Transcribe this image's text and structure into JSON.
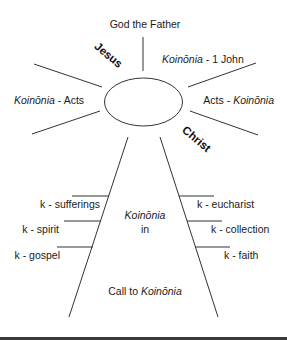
{
  "diagram": {
    "top_label": "God the Father",
    "jesus_label": "Jesus",
    "christ_label": "Christ",
    "upper_right": {
      "italic": "Koinōnia",
      "plain": " - 1 John"
    },
    "left_middle": {
      "italic": "Koinōnia",
      "plain": " - Acts"
    },
    "right_middle": {
      "plain": "Acts - ",
      "italic": "Koinōnia"
    },
    "center": {
      "line1": "Koinōnia",
      "line2": "in"
    },
    "bottom": {
      "plain": "Call to ",
      "italic": "Koinōnia"
    },
    "left_branches": [
      {
        "label": "k - sufferings"
      },
      {
        "label": "k - spirit"
      },
      {
        "label": "k - gospel"
      }
    ],
    "right_branches": [
      {
        "label": "k - eucharist"
      },
      {
        "label": "k - collection"
      },
      {
        "label": "k - faith"
      }
    ],
    "colors": {
      "line": "#333333",
      "text": "#1a1a1a",
      "bottom_bar": "#3a3a3a"
    }
  }
}
